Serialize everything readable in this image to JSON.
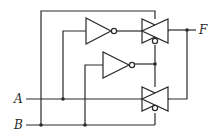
{
  "diagram": {
    "type": "logic-circuit",
    "inputs": [
      {
        "id": "A",
        "label": "A"
      },
      {
        "id": "B",
        "label": "B"
      }
    ],
    "outputs": [
      {
        "id": "F",
        "label": "F"
      }
    ],
    "components": [
      {
        "id": "inv1",
        "type": "NOT",
        "input": "A",
        "output": "TG1 control"
      },
      {
        "id": "inv2",
        "type": "NOT",
        "input": "B",
        "output": "TG control node"
      },
      {
        "id": "tg1",
        "type": "transmission-gate",
        "position": "top"
      },
      {
        "id": "tg2",
        "type": "transmission-gate",
        "position": "bottom"
      }
    ],
    "colors": {
      "line": "#2a2a2a",
      "background": "#ffffff"
    }
  }
}
